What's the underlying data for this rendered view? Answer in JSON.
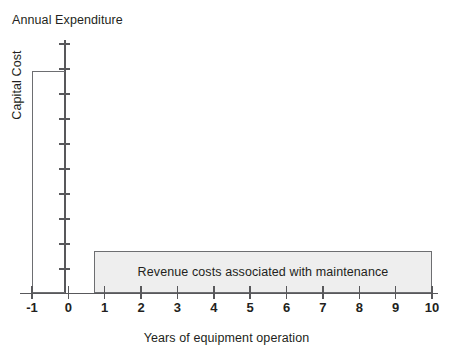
{
  "chart_data": {
    "type": "bar",
    "title": "Annual Expenditure",
    "xlabel": "Years of equipment operation",
    "ylabel": "Annual Expenditure",
    "grid": false,
    "legend": "none",
    "xlim": [
      -1,
      10
    ],
    "ylim": [
      0,
      10
    ],
    "x_tick_labels": [
      "-1",
      "0",
      "1",
      "2",
      "3",
      "4",
      "5",
      "6",
      "7",
      "8",
      "9",
      "10"
    ],
    "x_tick_values": [
      -1,
      0,
      1,
      2,
      3,
      4,
      5,
      6,
      7,
      8,
      9,
      10
    ],
    "y_tick_count": 10,
    "y_tick_labels": [],
    "series": [
      {
        "name": "Capital Cost",
        "label": "Capital Cost",
        "x_start": -1,
        "x_end": 0,
        "value": 8.75,
        "fill": "none",
        "outline": "#6d6e71"
      },
      {
        "name": "Revenue costs associated with maintenance",
        "label": "Revenue costs associated with maintenance",
        "x_start": 1,
        "x_end": 10,
        "value": 1.65,
        "fill": "#eeeeee",
        "outline": "#6d6e71"
      }
    ],
    "annotations": [
      "Capital Cost",
      "Revenue costs associated with maintenance"
    ]
  },
  "colors": {
    "axis": "#58585b",
    "outline": "#6d6e71",
    "bar_fill": "#eeeeee",
    "text": "#231f20",
    "background": "#ffffff"
  }
}
